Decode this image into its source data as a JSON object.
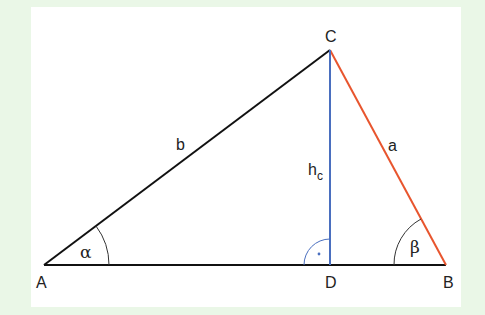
{
  "colors": {
    "background": "#eaf7e7",
    "panel": "#ffffff",
    "side_b": "#111111",
    "side_c": "#111111",
    "side_a": "#e8552e",
    "altitude": "#4a6fbf",
    "arcs": "#333333"
  },
  "vertices": {
    "A": {
      "label": "A",
      "x": 44,
      "y": 265
    },
    "B": {
      "label": "B",
      "x": 446,
      "y": 265
    },
    "C": {
      "label": "C",
      "x": 330,
      "y": 50
    },
    "D": {
      "label": "D",
      "x": 330,
      "y": 265
    }
  },
  "sides": {
    "a": {
      "label": "a",
      "from": "B",
      "to": "C",
      "color": "#e8552e"
    },
    "b": {
      "label": "b",
      "from": "A",
      "to": "C",
      "color": "#111111"
    },
    "c": {
      "label": "",
      "from": "A",
      "to": "B",
      "color": "#111111"
    }
  },
  "altitude": {
    "label_main": "h",
    "label_sub": "c",
    "from": "C",
    "to": "D",
    "color": "#4a6fbf"
  },
  "angles": {
    "alpha": {
      "label": "α",
      "vertex": "A"
    },
    "beta": {
      "label": "β",
      "vertex": "B"
    },
    "right_angle": {
      "label": "·",
      "vertex": "D"
    }
  }
}
